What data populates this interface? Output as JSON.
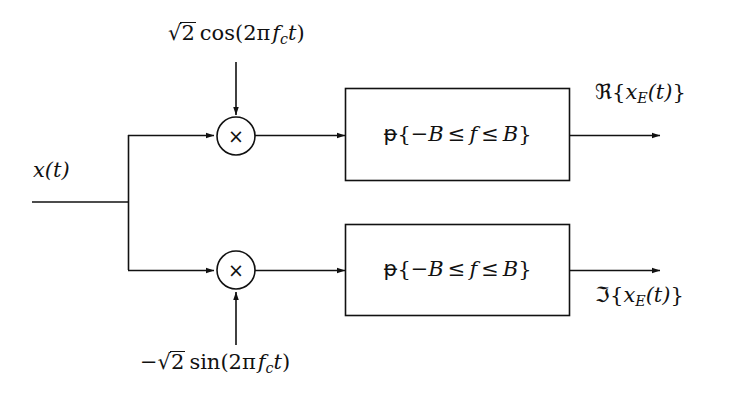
{
  "diagram": {
    "background_color": "#ffffff",
    "line_color": "#111111",
    "text_color": "#111111"
  },
  "input": {
    "label_plain": "x(t)",
    "label_base": "x",
    "label_paren": "(t)"
  },
  "carriers": {
    "top": {
      "name": "cosine-carrier",
      "plain": "√2 cos(2π f_c t)",
      "sqrt_symbol": "√",
      "sqrt_radicand": "2",
      "function": "cos",
      "open_paren": "(",
      "two_pi": "2π",
      "carrier_symbol": "f",
      "carrier_subscript": "c",
      "time_symbol": "t",
      "close_paren": ")",
      "sign": ""
    },
    "bottom": {
      "name": "negative-sine-carrier",
      "plain": "−√2 sin(2π f_c t)",
      "sqrt_symbol": "√",
      "sqrt_radicand": "2",
      "function": "sin",
      "open_paren": "(",
      "two_pi": "2π",
      "carrier_symbol": "f",
      "carrier_subscript": "c",
      "time_symbol": "t",
      "close_paren": ")",
      "sign": "−"
    }
  },
  "mixers": [
    {
      "name": "in-phase-mixer",
      "glyph": "×"
    },
    {
      "name": "quadrature-mixer",
      "glyph": "×"
    }
  ],
  "filters": [
    {
      "name": "in-phase-lowpass-filter",
      "plain": "1{-B ≤ f ≤ B}",
      "indicator": "ᵽ",
      "open_brace": "{",
      "neg_band": "−B",
      "le_left": "≤",
      "freq": "f",
      "le_right": "≤",
      "pos_band": "B",
      "close_brace": "}"
    },
    {
      "name": "quadrature-lowpass-filter",
      "plain": "1{-B ≤ f ≤ B}",
      "indicator": "ᵽ",
      "open_brace": "{",
      "neg_band": "−B",
      "le_left": "≤",
      "freq": "f",
      "le_right": "≤",
      "pos_band": "B",
      "close_brace": "}"
    }
  ],
  "outputs": {
    "top": {
      "name": "real-part-output",
      "plain": "ℜ{x_E(t)}",
      "operator": "ℜ",
      "open_brace": "{",
      "signal": "x",
      "subscript": "E",
      "arg": "(t)",
      "close_brace": "}"
    },
    "bottom": {
      "name": "imaginary-part-output",
      "plain": "ℑ{x_E(t)}",
      "operator": "ℑ",
      "open_brace": "{",
      "signal": "x",
      "subscript": "E",
      "arg": "(t)",
      "close_brace": "}"
    }
  }
}
